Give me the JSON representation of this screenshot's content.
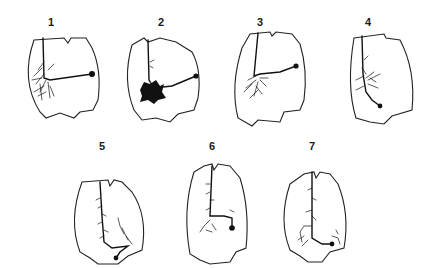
{
  "figure": {
    "panels": [
      {
        "label": "1"
      },
      {
        "label": "2"
      },
      {
        "label": "3"
      },
      {
        "label": "4"
      },
      {
        "label": "5"
      },
      {
        "label": "6"
      },
      {
        "label": "7"
      }
    ]
  }
}
